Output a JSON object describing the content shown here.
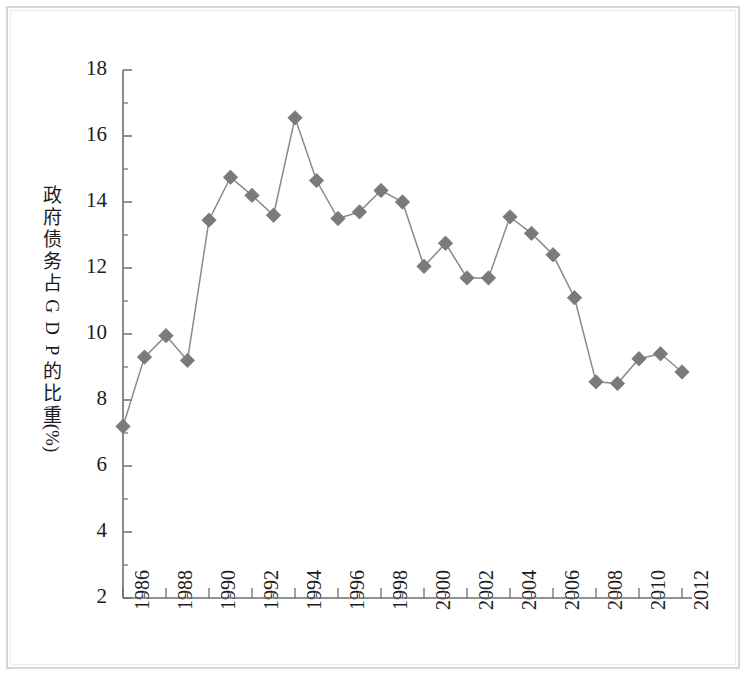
{
  "chart_data": {
    "type": "line",
    "title": "",
    "subtitle": "",
    "xlabel": "",
    "ylabel": "政府债务占GDP的比重(%)",
    "ylabel_chars": [
      "政",
      "府",
      "债",
      "务",
      "占",
      "G",
      "D",
      "P",
      "的",
      "比",
      "重",
      "(%)"
    ],
    "xlim": [
      1986,
      2012
    ],
    "ylim": [
      2,
      18
    ],
    "y_ticks": [
      2,
      4,
      6,
      8,
      10,
      12,
      14,
      16,
      18
    ],
    "y_tick_labels": [
      "2",
      "4",
      "6",
      "8",
      "10",
      "12",
      "14",
      "16",
      "18"
    ],
    "y_minor_ticks": [
      3,
      5,
      7,
      9,
      11,
      13,
      15,
      17
    ],
    "x_ticks": [
      1986,
      1987,
      1988,
      1989,
      1990,
      1991,
      1992,
      1993,
      1994,
      1995,
      1996,
      1997,
      1998,
      1999,
      2000,
      2001,
      2002,
      2003,
      2004,
      2005,
      2006,
      2007,
      2008,
      2009,
      2010,
      2011,
      2012
    ],
    "x_tick_labels": [
      "1986",
      "",
      "1988",
      "",
      "1990",
      "",
      "1992",
      "",
      "1994",
      "",
      "1996",
      "",
      "1998",
      "",
      "2000",
      "",
      "2002",
      "",
      "2004",
      "",
      "2006",
      "",
      "2008",
      "",
      "2010",
      "",
      "2012"
    ],
    "grid": false,
    "legend": false,
    "legend_position": "none",
    "marker": "diamond",
    "line_color": "#8a8a8a",
    "marker_color": "#7a7a7a",
    "axis_color": "#6e6e6e",
    "x": [
      1986,
      1987,
      1988,
      1989,
      1990,
      1991,
      1992,
      1993,
      1994,
      1995,
      1996,
      1997,
      1998,
      1999,
      2000,
      2001,
      2002,
      2003,
      2004,
      2005,
      2006,
      2007,
      2008,
      2009,
      2010,
      2011,
      2012
    ],
    "categories": [
      "1986",
      "1987",
      "1988",
      "1989",
      "1990",
      "1991",
      "1992",
      "1993",
      "1994",
      "1995",
      "1996",
      "1997",
      "1998",
      "1999",
      "2000",
      "2001",
      "2002",
      "2003",
      "2004",
      "2005",
      "2006",
      "2007",
      "2008",
      "2009",
      "2010",
      "2011",
      "2012"
    ],
    "values": [
      7.2,
      9.3,
      9.95,
      9.2,
      13.45,
      14.75,
      14.2,
      13.6,
      16.55,
      14.65,
      13.5,
      13.7,
      14.35,
      14.0,
      12.05,
      12.75,
      11.7,
      11.7,
      13.55,
      13.05,
      12.4,
      11.1,
      8.55,
      8.5,
      9.25,
      9.4,
      8.85
    ],
    "series": [
      {
        "name": "政府债务占GDP的比重",
        "values": [
          7.2,
          9.3,
          9.95,
          9.2,
          13.45,
          14.75,
          14.2,
          13.6,
          16.55,
          14.65,
          13.5,
          13.7,
          14.35,
          14.0,
          12.05,
          12.75,
          11.7,
          11.7,
          13.55,
          13.05,
          12.4,
          11.1,
          8.55,
          8.5,
          9.25,
          9.4,
          8.85
        ]
      }
    ]
  }
}
